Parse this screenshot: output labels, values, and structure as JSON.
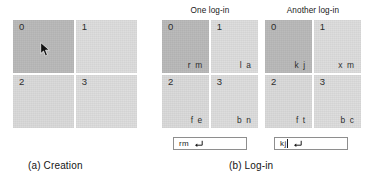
{
  "figure": {
    "panels": [
      {
        "id": "creation",
        "title": "",
        "caption": "(a) Creation",
        "cells": [
          {
            "index": "0",
            "code": "",
            "shade": "dark",
            "selected": true
          },
          {
            "index": "1",
            "code": "",
            "shade": "light",
            "selected": false
          },
          {
            "index": "2",
            "code": "",
            "shade": "lighter",
            "selected": false
          },
          {
            "index": "3",
            "code": "",
            "shade": "light",
            "selected": false
          }
        ],
        "cursor": {
          "icon": "mouse-pointer-icon",
          "x": 40,
          "y": 42,
          "in_cell": "0"
        },
        "entry": null
      },
      {
        "id": "one-login",
        "title": "One log-in",
        "caption": "",
        "cells": [
          {
            "index": "0",
            "code": "r m",
            "shade": "dark",
            "selected": true
          },
          {
            "index": "1",
            "code": "l a",
            "shade": "light",
            "selected": false
          },
          {
            "index": "2",
            "code": "f e",
            "shade": "lighter",
            "selected": false
          },
          {
            "index": "3",
            "code": "b n",
            "shade": "light",
            "selected": false
          }
        ],
        "cursor": null,
        "entry": {
          "value": "rm",
          "placeholder": "",
          "caret": false,
          "enter_icon": "enter-key-icon"
        }
      },
      {
        "id": "another-login",
        "title": "Another log-in",
        "caption": "",
        "cells": [
          {
            "index": "0",
            "code": "k j",
            "shade": "dark",
            "selected": true
          },
          {
            "index": "1",
            "code": "x m",
            "shade": "light",
            "selected": false
          },
          {
            "index": "2",
            "code": "f t",
            "shade": "lighter",
            "selected": false
          },
          {
            "index": "3",
            "code": "b c",
            "shade": "light",
            "selected": false
          }
        ],
        "cursor": null,
        "entry": {
          "value": "kj",
          "placeholder": "",
          "caret": true,
          "enter_icon": "enter-key-icon"
        }
      }
    ],
    "captions": {
      "left": "(a) Creation",
      "right": "(b) Log-in"
    },
    "colors": {
      "background": "#ffffff",
      "cell_selected": "#b9b9b9",
      "cell_normal": "#d9d9d9",
      "text": "#1a1a1a",
      "entry_border": "#8e8e8e"
    }
  }
}
